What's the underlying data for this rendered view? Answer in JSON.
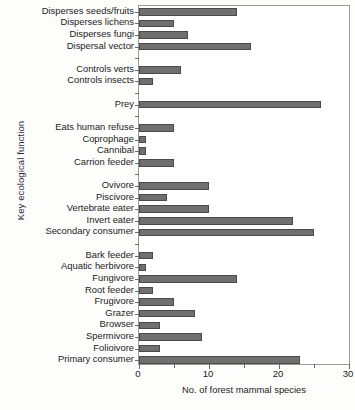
{
  "chart_data": {
    "type": "bar",
    "orientation": "horizontal",
    "title": "",
    "xlabel": "No. of forest mammal species",
    "ylabel": "Key ecological function",
    "xlim": [
      0,
      30
    ],
    "xticks": [
      0,
      5,
      10,
      15,
      20,
      25,
      30
    ],
    "xticklabels": [
      "0",
      "",
      "10",
      "",
      "20",
      "",
      "30"
    ],
    "grid": false,
    "legend": null,
    "bar_color": "#6f6f6f",
    "bar_edge_color": "#4a4a4a",
    "frame": "box",
    "categories": [
      "Disperses seeds/fruits",
      "Disperses lichens",
      "Disperses fungi",
      "Dispersal vector",
      "",
      "Controls verts",
      "Controls insects",
      "",
      "Prey",
      "",
      "Eats human refuse",
      "Coprophage",
      "Cannibal",
      "Carrion feeder",
      "",
      "Ovivore",
      "Piscivore",
      "Vertebrate eater",
      "Invert eater",
      "Secondary consumer",
      "",
      "Bark feeder",
      "Aquatic herbivore",
      "Fungivore",
      "Root feeder",
      "Frugivore",
      "Grazer",
      "Browser",
      "Spermivore",
      "Folioivore",
      "Primary consumer"
    ],
    "values": [
      14,
      5,
      7,
      16,
      null,
      6,
      2,
      null,
      26,
      null,
      5,
      1,
      1,
      5,
      null,
      10,
      4,
      10,
      22,
      25,
      null,
      2,
      1,
      14,
      2,
      5,
      8,
      3,
      9,
      3,
      23
    ]
  }
}
